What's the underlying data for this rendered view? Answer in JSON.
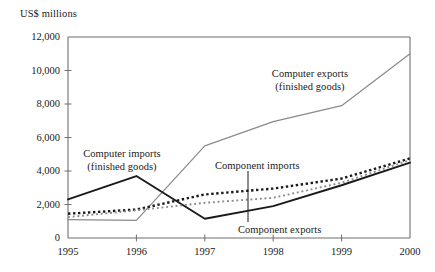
{
  "axis_title": "US$ millions",
  "y_axis": {
    "ticks": [
      {
        "value": 12000,
        "label": "12,000"
      },
      {
        "value": 10000,
        "label": "10,000"
      },
      {
        "value": 8000,
        "label": "8,000"
      },
      {
        "value": 6000,
        "label": "6,000"
      },
      {
        "value": 4000,
        "label": "4,000"
      },
      {
        "value": 2000,
        "label": "2,000"
      },
      {
        "value": 0,
        "label": "0"
      }
    ]
  },
  "x_axis": {
    "ticks": [
      {
        "value": 1995,
        "label": "1995"
      },
      {
        "value": 1996,
        "label": "1996"
      },
      {
        "value": 1997,
        "label": "1997"
      },
      {
        "value": 1998,
        "label": "1998"
      },
      {
        "value": 1999,
        "label": "1999"
      },
      {
        "value": 2000,
        "label": "2000"
      }
    ]
  },
  "annotations": {
    "computer_imports_line1": "Computer imports",
    "computer_imports_line2": "(finished goods)",
    "computer_exports_line1": "Computer exports",
    "computer_exports_line2": "(finished goods)",
    "component_imports": "Component imports",
    "component_exports": "Component exports"
  },
  "colors": {
    "computer_exports": "#8a8a8a",
    "computer_imports": "#1a1a1a",
    "component_imports": "#1a1a1a",
    "component_exports": "#8a8a8a",
    "axis": "#6f6f6f",
    "text": "#1a1a1a"
  },
  "chart_data": {
    "type": "line",
    "title": "",
    "subtitle": "",
    "xlabel": "",
    "ylabel": "US$ millions",
    "xlim": [
      1995,
      2000
    ],
    "ylim": [
      0,
      12000
    ],
    "grid": false,
    "legend_position": "inline-annotations",
    "x": [
      1995,
      1996,
      1997,
      1998,
      1999,
      2000
    ],
    "series": [
      {
        "name": "Computer exports (finished goods)",
        "style": "solid",
        "color": "#8a8a8a",
        "values": [
          1100,
          1050,
          5500,
          6950,
          7900,
          11000
        ]
      },
      {
        "name": "Computer imports (finished goods)",
        "style": "solid",
        "color": "#1a1a1a",
        "values": [
          2300,
          3700,
          1150,
          1900,
          3150,
          4500
        ]
      },
      {
        "name": "Component imports",
        "style": "dotted-heavy",
        "color": "#1a1a1a",
        "values": [
          1450,
          1700,
          2600,
          2950,
          3550,
          4750
        ]
      },
      {
        "name": "Component exports",
        "style": "dotted-light",
        "color": "#8a8a8a",
        "values": [
          1250,
          1650,
          2100,
          2400,
          3300,
          4650
        ]
      }
    ]
  }
}
